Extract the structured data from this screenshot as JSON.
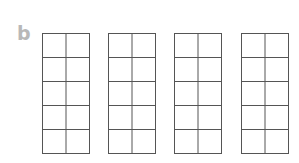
{
  "label": "b",
  "frames": [
    {
      "rows": 5,
      "cols": 2,
      "left": 42
    },
    {
      "rows": 5,
      "cols": 2,
      "left": 108
    },
    {
      "rows": 5,
      "cols": 2,
      "left": 174
    },
    {
      "rows": 5,
      "cols": 2,
      "left": 241
    }
  ],
  "colors": {
    "grid": "#555555",
    "label": "#b8b8b8"
  }
}
